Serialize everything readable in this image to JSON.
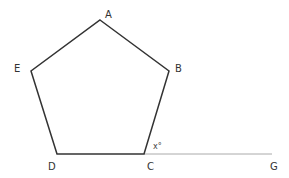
{
  "diagram": {
    "type": "geometry",
    "shape": "regular pentagon",
    "vertices": [
      {
        "label": "A",
        "x": 100,
        "y": 20,
        "label_x": 105,
        "label_y": 18
      },
      {
        "label": "B",
        "x": 169,
        "y": 71,
        "label_x": 175,
        "label_y": 72
      },
      {
        "label": "C",
        "x": 144,
        "y": 154,
        "label_x": 147,
        "label_y": 170
      },
      {
        "label": "D",
        "x": 57,
        "y": 154,
        "label_x": 48,
        "label_y": 170
      },
      {
        "label": "E",
        "x": 31,
        "y": 71,
        "label_x": 14,
        "label_y": 72
      }
    ],
    "extension": {
      "from": "C",
      "to": "G",
      "label": "G",
      "x": 272,
      "y": 154,
      "label_x": 270,
      "label_y": 170
    },
    "angle": {
      "label": "x°",
      "at": "C",
      "label_x": 153,
      "label_y": 149
    },
    "colors": {
      "polygon_stroke": "#333333",
      "extension_stroke": "#aaaaaa"
    }
  }
}
